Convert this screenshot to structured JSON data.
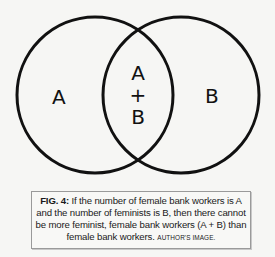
{
  "diagram": {
    "type": "venn",
    "circles": [
      {
        "id": "A",
        "label": "A",
        "cx": 95,
        "cy": 95,
        "r": 78
      },
      {
        "id": "B",
        "label": "B",
        "cx": 181,
        "cy": 95,
        "r": 78
      }
    ],
    "labels": {
      "left": "A",
      "right": "B",
      "intersection_top": "A",
      "intersection_mid": "+",
      "intersection_bottom": "B"
    },
    "stroke_color": "#111111",
    "background_color": "#f6f6f4"
  },
  "caption": {
    "fig_label": "FIG. 4:",
    "text": " If the number of female bank workers is A and the number of feminists is B, then there cannot be more feminist, female bank workers (A + B) than female bank workers. ",
    "credit": "Author's image."
  }
}
